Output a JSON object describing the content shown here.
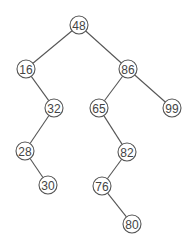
{
  "diagram": {
    "type": "binary-search-tree",
    "root": "48",
    "nodes": [
      {
        "id": "48",
        "label": "48",
        "x": 79,
        "y": 25
      },
      {
        "id": "16",
        "label": "16",
        "x": 26,
        "y": 69
      },
      {
        "id": "86",
        "label": "86",
        "x": 128,
        "y": 69
      },
      {
        "id": "32",
        "label": "32",
        "x": 54,
        "y": 108
      },
      {
        "id": "65",
        "label": "65",
        "x": 99,
        "y": 108
      },
      {
        "id": "99",
        "label": "99",
        "x": 172,
        "y": 108
      },
      {
        "id": "28",
        "label": "28",
        "x": 25,
        "y": 151
      },
      {
        "id": "82",
        "label": "82",
        "x": 127,
        "y": 152
      },
      {
        "id": "30",
        "label": "30",
        "x": 48,
        "y": 185
      },
      {
        "id": "76",
        "label": "76",
        "x": 102,
        "y": 186
      },
      {
        "id": "80",
        "label": "80",
        "x": 132,
        "y": 224
      }
    ],
    "edges": [
      {
        "from": "48",
        "to": "16"
      },
      {
        "from": "48",
        "to": "86"
      },
      {
        "from": "16",
        "to": "32"
      },
      {
        "from": "86",
        "to": "65"
      },
      {
        "from": "86",
        "to": "99"
      },
      {
        "from": "32",
        "to": "28"
      },
      {
        "from": "65",
        "to": "82"
      },
      {
        "from": "28",
        "to": "30"
      },
      {
        "from": "82",
        "to": "76"
      },
      {
        "from": "76",
        "to": "80"
      }
    ],
    "node_radius": 9
  }
}
